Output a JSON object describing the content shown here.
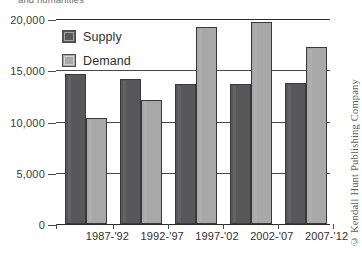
{
  "caption_tail": "and humanities",
  "credit": "© Kendall Hunt Publishing Company",
  "legend": {
    "items": [
      {
        "label": "Supply",
        "color": "#58585a",
        "swatch_icon": "square-swatch-icon"
      },
      {
        "label": "Demand",
        "color": "#a8a8a8",
        "swatch_icon": "square-swatch-icon"
      }
    ]
  },
  "axis": {
    "y_ticks": [
      "0",
      "5,000",
      "10,000",
      "15,000",
      "20,000"
    ],
    "x_ticks": [
      "1987-'92",
      "1992-'97",
      "1997-'02",
      "2002-'07",
      "2007-'12"
    ]
  },
  "chart_data": {
    "type": "bar",
    "title": "",
    "subtitle": "",
    "xlabel": "",
    "ylabel": "",
    "ylim": [
      0,
      20000
    ],
    "ytick_values": [
      0,
      5000,
      10000,
      15000,
      20000
    ],
    "ytick_labels": [
      "0",
      "5,000",
      "10,000",
      "15,000",
      "20,000"
    ],
    "grid": "horizontal",
    "legend_position": "inside-top-left",
    "categories": [
      "1987-'92",
      "1992-'97",
      "1997-'02",
      "2002-'07",
      "2007-'12"
    ],
    "series": [
      {
        "name": "Supply",
        "color": "#58585a",
        "values": [
          14600,
          14100,
          13700,
          13700,
          13800
        ]
      },
      {
        "name": "Demand",
        "color": "#a8a8a8",
        "values": [
          10300,
          12100,
          19200,
          19700,
          17300
        ]
      }
    ]
  }
}
